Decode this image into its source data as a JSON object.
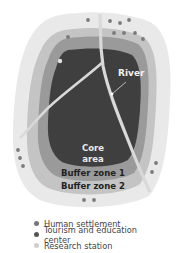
{
  "diagram": {
    "labels": {
      "river": "River",
      "core": "Core",
      "core2": "area",
      "buffer1": "Buffer zone 1",
      "buffer2": "Buffer zone 2"
    },
    "colors": {
      "outer": "#e9e9e9",
      "buffer2": "#c4c4c4",
      "buffer1": "#9a9a9a",
      "core": "#3f3f3f",
      "river": "#d9d9d9"
    }
  },
  "legend": {
    "items": [
      {
        "label": "Human settlement",
        "icon": "settlement-marker",
        "color": "#777777"
      },
      {
        "label": "Tourism and education center",
        "icon": "tourism-marker",
        "color": "#555555"
      },
      {
        "label": "Research station",
        "icon": "research-marker",
        "color": "#cfcfcf"
      }
    ]
  }
}
